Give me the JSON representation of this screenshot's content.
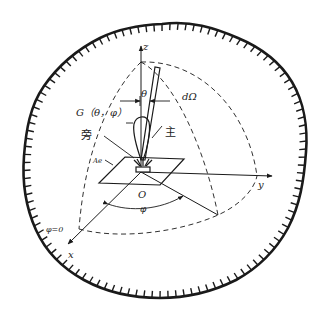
{
  "figure": {
    "labels": {
      "z_axis": "z",
      "x_axis": "x",
      "y_axis": "y",
      "origin": "O",
      "theta": "θ",
      "phi": "φ",
      "phi_zero": "φ=0",
      "solid_angle": "dΩ",
      "gain": "G（θ，φ）",
      "side_lobe": "旁",
      "main_lobe": "主",
      "aperture": "Ae"
    },
    "colors": {
      "line": "#1a1a1a",
      "background": "#ffffff"
    }
  }
}
